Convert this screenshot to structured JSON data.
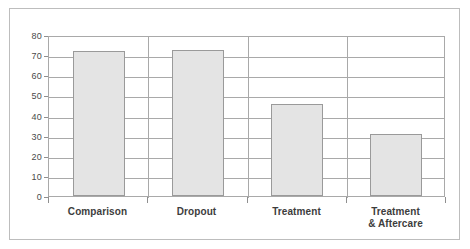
{
  "chart_data": {
    "type": "bar",
    "title": "",
    "subtitle": "",
    "xlabel": "",
    "ylabel": "",
    "categories": [
      "Comparison",
      "Dropout",
      "Treatment",
      "Treatment\n& Aftercare"
    ],
    "values": [
      72,
      72.5,
      45.5,
      31
    ],
    "ylim": [
      0,
      80
    ],
    "yticks": [
      0,
      10,
      20,
      30,
      40,
      50,
      60,
      70,
      80
    ],
    "ytick_labels": [
      "0",
      "10",
      "20",
      "30",
      "40",
      "50",
      "60",
      "70",
      "80"
    ],
    "grid": true,
    "grid_axis": "y",
    "legend": false,
    "legend_position": "none",
    "bar_fill_color": "#e4e4e4",
    "bar_edge_color": "#9a9a9a",
    "grid_color": "#a9a9a9",
    "axis_color": "#a9a9a9",
    "frame_color": "#bdbdbd",
    "label_color": "#3d3d3d",
    "tick_label_color": "#4a4a4a",
    "background_color": "#ffffff"
  }
}
